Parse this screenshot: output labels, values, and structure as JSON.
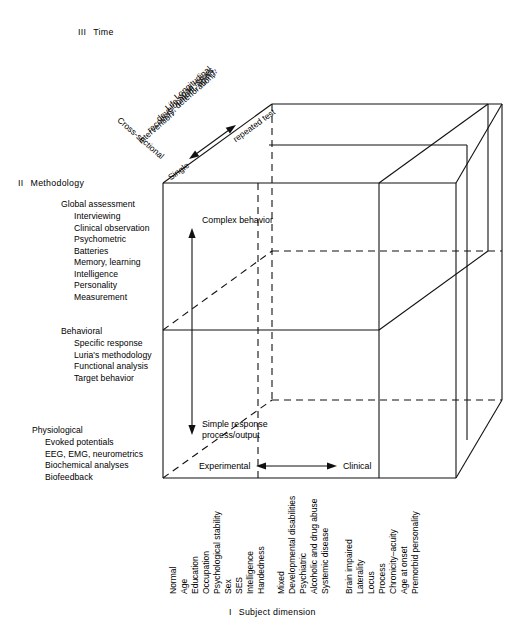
{
  "figure": {
    "caption": {
      "numeral": "I",
      "text": "Subject dimension"
    }
  },
  "axes": {
    "time": {
      "numeral": "III",
      "label": "Time",
      "diagonal_items": [
        "Longitudinal",
        "Life span issues,",
        "development, aging,",
        "recovery, deterioration,",
        "intervention"
      ],
      "cross_sectional": "Cross-sectional",
      "single": "Single",
      "repeated_test": "repeated test"
    },
    "methodology": {
      "numeral": "II",
      "label": "Methodology",
      "groups": [
        {
          "title": "Global assessment",
          "items": [
            "Interviewing",
            "Clinical observation",
            "Psychometric",
            "Batteries",
            "Memory, learning",
            "Intelligence",
            "Personality",
            "Measurement"
          ]
        },
        {
          "title": "Behavioral",
          "items": [
            "Specific response",
            "Luria's methodology",
            "Functional analysis",
            "Target behavior"
          ]
        },
        {
          "title": "Physiological",
          "items": [
            "Evoked potentials",
            "EEG, EMG, neurometrics",
            "Biochemical analyses",
            "Biofeedback"
          ]
        }
      ]
    },
    "subject": {
      "numeral": "I",
      "label": "Subject dimension",
      "groups": [
        {
          "name": "normal-group",
          "items": [
            "Normal",
            "Age",
            "Education",
            "Occupation",
            "Psychological stability",
            "Sex",
            "SES",
            "Intelligence",
            "Handedness"
          ]
        },
        {
          "name": "mixed-group",
          "items": [
            "Mixed",
            "Developmental disabilities",
            "Psychiatric",
            "Alcoholic and drug abuse",
            "Systemic disease"
          ]
        },
        {
          "name": "brain-impaired-group",
          "items": [
            "Brain impaired",
            "Laterality",
            "Locus",
            "Process",
            "Chronicity–acuity",
            "Age at onset",
            "Premorbid personality"
          ]
        }
      ]
    }
  },
  "cube_labels": {
    "complex_behavior": "Complex behavior",
    "simple_response_line1": "Simple response",
    "simple_response_line2": "process/output",
    "experimental": "Experimental",
    "clinical": "Clinical"
  },
  "colors": {
    "line": "#111111",
    "text": "#000000",
    "background": "#ffffff"
  }
}
